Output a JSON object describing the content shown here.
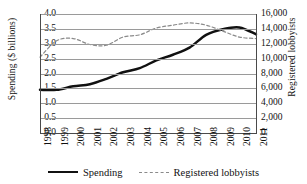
{
  "chart_data": {
    "type": "line",
    "title": "",
    "xlabel": "",
    "categories": [
      "1998",
      "1999",
      "2000",
      "2001",
      "2002",
      "2003",
      "2004",
      "2005",
      "2006",
      "2007",
      "2008",
      "2009",
      "2010",
      "2011"
    ],
    "grid": true,
    "legend_position": "bottom",
    "axes": {
      "left": {
        "label": "Spending ($ billions)",
        "min": 0.0,
        "max": 4.0,
        "step": 0.5,
        "ticks": [
          "0.0",
          "0.5",
          "1.0",
          "1.5",
          "2.0",
          "2.5",
          "3.0",
          "3.5",
          "4.0"
        ]
      },
      "right": {
        "label": "Registered lobbyists",
        "min": 0,
        "max": 16000,
        "step": 2000,
        "ticks": [
          "0",
          "2,000",
          "4,000",
          "6,000",
          "8,000",
          "10,000",
          "12,000",
          "14,000",
          "16,000"
        ]
      }
    },
    "series": [
      {
        "name": "Spending",
        "axis": "left",
        "style": "solid",
        "color": "#111111",
        "values": [
          1.45,
          1.45,
          1.57,
          1.64,
          1.82,
          2.04,
          2.18,
          2.44,
          2.63,
          2.87,
          3.3,
          3.49,
          3.55,
          3.32
        ]
      },
      {
        "name": "Registered lobbyists",
        "axis": "right",
        "style": "dashed",
        "color": "#8a8a8a",
        "values": [
          10200,
          12400,
          12700,
          11900,
          11800,
          12900,
          13200,
          14100,
          14500,
          14800,
          14500,
          13700,
          12900,
          12700
        ]
      }
    ]
  },
  "legend": {
    "items": [
      {
        "label": "Spending",
        "style": "solid"
      },
      {
        "label": "Registered lobbyists",
        "style": "dashed"
      }
    ]
  }
}
